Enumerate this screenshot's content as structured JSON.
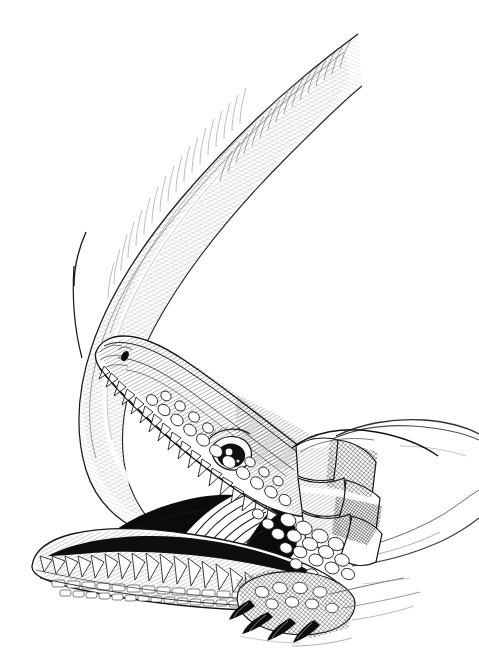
{
  "artwork": {
    "title": "Crocodilian with open jaws and extended tongue",
    "medium": "pen-and-ink stipple and cross-hatch line drawing",
    "subject": "crocodile",
    "orientation": "portrait",
    "width_px": 479,
    "height_px": 669,
    "background_color": "#ffffff",
    "ink_color": "#111111",
    "mid_tone_color": "#555555",
    "light_tone_color": "#9a9a9a",
    "has_text": false,
    "has_border": false,
    "has_signature": false,
    "visible_text": ""
  },
  "parts": [
    {
      "id": "tongue-ribbon",
      "label": "extended tongue ribbon",
      "description": "long tapering ribbon sweeping from upper-right, curving down the left side and re-entering the mouth",
      "shading": "fine parallel hatching and cross-hatch along the lower edge",
      "tone": "light"
    },
    {
      "id": "upper-jaw",
      "label": "upper jaw and snout",
      "description": "elongated snout angled up-left with nostril marking near the tip",
      "shading": "dense short hatching over scaled skin",
      "tone": "mid"
    },
    {
      "id": "upper-teeth",
      "label": "upper tooth row",
      "description": "row of conical white teeth along the upper jaw margin",
      "tone": "white"
    },
    {
      "id": "eye",
      "label": "eye",
      "description": "almond eye with bright white highlight and dark pupil, set behind the snout",
      "tone": "dark"
    },
    {
      "id": "mouth-cavity",
      "label": "open mouth interior",
      "description": "solid black gape between the jaws",
      "tone": "black"
    },
    {
      "id": "lower-jaw",
      "label": "lower jaw",
      "description": "broad lower jaw extending to the left with ventral scale rows",
      "tone": "mid"
    },
    {
      "id": "lower-teeth",
      "label": "lower tooth row",
      "description": "row of white conical teeth along the lower jaw",
      "tone": "white"
    },
    {
      "id": "neck-plates",
      "label": "neck scute plates",
      "description": "large keeled nuchal plates with heavy cross-hatching",
      "tone": "mid-dark"
    },
    {
      "id": "body",
      "label": "body and flank",
      "description": "body receding to the right edge with light contour outlines",
      "tone": "light"
    },
    {
      "id": "foot",
      "label": "clawed forefoot",
      "description": "scaled foot with four dark curved claws resting on the ground",
      "tone": "dark"
    },
    {
      "id": "ground-shadow",
      "label": "ground line",
      "description": "faint broken contour lines suggesting the ground beneath the foot",
      "tone": "light"
    }
  ]
}
